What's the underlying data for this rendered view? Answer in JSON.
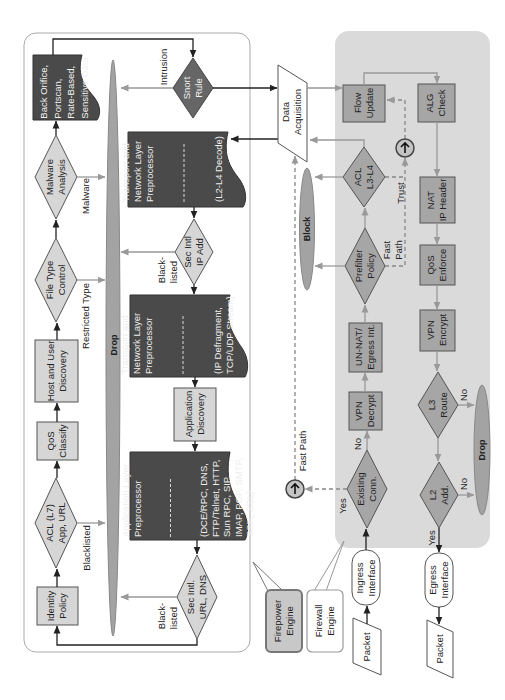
{
  "diagram": {
    "type": "flowchart",
    "orientation": "rotated 90 degrees (text reads bottom-to-top)",
    "callouts": {
      "firepower_engine": "Firepower\nEngine",
      "firewall_engine": "Firewall\nEngine"
    },
    "firepower": {
      "drop": "Drop",
      "identity_policy": "Identity\nPolicy",
      "acl_l7": "ACL (L7)\nApp, URL",
      "qos_classify": "QoS\nClassify",
      "host_user_discovery": "Host and User\nDiscovery",
      "file_type_control": "File Type\nControl",
      "malware_analysis": "Malware\nAnalysis",
      "intrusion_preprocessor": "Back Orifice,\nPortscan,\nRate-Based,\nSensitive Data",
      "snort_rule": "Snort\nRule",
      "l2l4_preprocessor": {
        "title": "Transport and\nNetwork Layer\nPreprocessor",
        "detail": "(L2-L4 Decode)"
      },
      "sec_intel_ip": "Sec Intl\nIP Add",
      "stream_preprocessor": {
        "title": "Transport and\nNetwork Layer\nPreprocessor",
        "detail": "(IP Defragment,\nTCP/UDP Stream)"
      },
      "application_discovery": "Application\nDiscovery",
      "app_layer_preprocessor": {
        "title": "Application Layer\nPreprocessor",
        "detail": "(DCE/RPC, DNS,\nFTP/Telnet, HTTP,\nSun RPC, SIP,\nIMAP, POP, SMTP,\nSSH, SSL)"
      },
      "sec_intel_url_dns": "Sec Intl.\nURL, DNS",
      "edge_labels": {
        "malware": "Malware",
        "restricted_type": "Restricted Type",
        "blacklisted": "Blacklisted",
        "intrusion": "Intrusion",
        "blacklisted_ip": "Black-\nlisted",
        "blacklisted_url": "Black-\nlisted"
      }
    },
    "firewall": {
      "data_acquisition": "Data\nAcquisition",
      "block": "Block",
      "flow_update": "Flow\nUpdate",
      "alg_check": "ALG\nCheck",
      "acl_l3l4": "ACL\nL3-L4",
      "prefilter_policy": "Prefilter\nPolicy",
      "un_nat": "UN-NAT/\nEgress Int.",
      "vpn_decrypt": "VPN\nDecrypt",
      "existing_conn": "Existing\nConn.",
      "nat_ip_header": "NAT\nIP Header",
      "qos_enforce": "QoS\nEnforce",
      "vpn_encrypt": "VPN\nEncrypt",
      "l3_route": "L3\nRoute",
      "l2_add": "L2\nAdd.",
      "drop": "Drop",
      "ingress_interface": "Ingress\nInterface",
      "egress_interface": "Egress\nInterface",
      "packet_in": "Packet",
      "packet_out": "Packet",
      "edge_labels": {
        "trust": "Trust",
        "fast_path_prefilter": "Fast\nPath",
        "fast_path": "Fast Path",
        "existing_yes": "Yes",
        "existing_no": "No",
        "l3_no": "No",
        "l2_no": "No",
        "l2_yes": "Yes"
      }
    },
    "colors": {
      "firewall_panel_bg": "#dadada",
      "firepower_node_fill": "#d6d6d6",
      "firewall_node_fill": "#a6a6a6",
      "preprocessor_fill": "#4a4a4a",
      "snort_fill": "#666666",
      "drop_block_fill": "#a3a3a3",
      "primary_arrow": "#222222",
      "secondary_arrow": "#999999"
    }
  }
}
